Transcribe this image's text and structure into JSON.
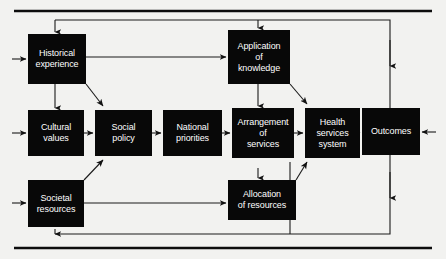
{
  "diagram": {
    "colors": {
      "node_fill": "#080808",
      "node_text": "#ffffff",
      "connector": "#1a1a1a",
      "rule": "#0d0d0d",
      "background": "#f2f2f0"
    },
    "nodes": [
      {
        "id": "historical-experience",
        "label": "Historical\nexperience",
        "x": 28,
        "y": 34,
        "w": 58,
        "h": 50
      },
      {
        "id": "application-of-knowledge",
        "label": "Application\nof\nknowledge",
        "x": 228,
        "y": 30,
        "w": 62,
        "h": 54
      },
      {
        "id": "cultural-values",
        "label": "Cultural\nvalues",
        "x": 28,
        "y": 110,
        "w": 56,
        "h": 46
      },
      {
        "id": "social-policy",
        "label": "Social\npolicy",
        "x": 95,
        "y": 110,
        "w": 57,
        "h": 46
      },
      {
        "id": "national-priorities",
        "label": "National\npriorities",
        "x": 163,
        "y": 110,
        "w": 59,
        "h": 46
      },
      {
        "id": "arrangement-of-services",
        "label": "Arrangement\nof\nservices",
        "x": 232,
        "y": 108,
        "w": 62,
        "h": 50
      },
      {
        "id": "health-services-system",
        "label": "Health\nservices\nsystem",
        "x": 305,
        "y": 108,
        "w": 55,
        "h": 50
      },
      {
        "id": "outcomes",
        "label": "Outcomes",
        "x": 362,
        "y": 108,
        "w": 58,
        "h": 47
      },
      {
        "id": "societal-resources",
        "label": "Societal\nresources",
        "x": 28,
        "y": 180,
        "w": 56,
        "h": 47
      },
      {
        "id": "allocation-of-resources",
        "label": "Allocation\nof resources",
        "x": 228,
        "y": 180,
        "w": 68,
        "h": 40
      }
    ],
    "rules": [
      {
        "id": "top-rule",
        "x1": 14,
        "y1": 11,
        "x2": 432,
        "y2": 11
      },
      {
        "id": "bottom-rule",
        "x1": 14,
        "y1": 248,
        "x2": 432,
        "y2": 248
      }
    ],
    "connector_count": 24
  }
}
